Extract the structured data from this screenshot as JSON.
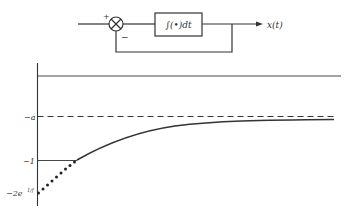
{
  "block_diagram": {
    "summing_junction": {
      "plus_sign": "+",
      "minus_sign": "−"
    },
    "integrator_block": {
      "label": "∫(•)dt"
    },
    "output_label": "x(t)"
  },
  "graph": {
    "y_labels": {
      "neg_a": "−a",
      "neg_one": "−1",
      "neg_2e": "−2e",
      "neg_2e_exp": "1/f"
    },
    "colors": {
      "line": "#333333",
      "background": "#ffffff"
    }
  }
}
